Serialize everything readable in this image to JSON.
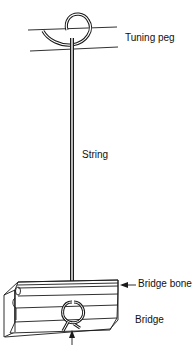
{
  "figure": {
    "type": "string-attachment-diagram",
    "labels": {
      "tuning_peg": "Tuning peg",
      "string": "String",
      "bridge_bone": "Bridge bone",
      "bridge": "Bridge",
      "knot_caption": "(text cut off at image edge)"
    },
    "colors": {
      "line": "#1a1a1a",
      "background": "#ffffff"
    }
  }
}
